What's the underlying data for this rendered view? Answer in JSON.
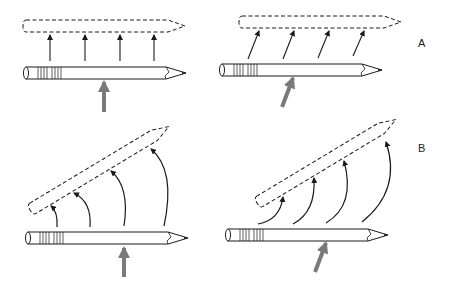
{
  "figure": {
    "panel_labels": {
      "A": "A",
      "B": "B"
    },
    "panels": [
      {
        "id": "A-left",
        "row": "A",
        "description": "Pencil lifted straight up; force arrow vertical at center; 4 parallel vertical motion arrows to dashed outline"
      },
      {
        "id": "A-right",
        "row": "A",
        "description": "Pencil lifted; force arrow oblique; 4 parallel slanted motion arrows to dashed outline"
      },
      {
        "id": "B-left",
        "row": "B",
        "description": "Pencil rotated about eraser end; vertical force arrow; 4 curved arrows of increasing length to tilted dashed outline"
      },
      {
        "id": "B-right",
        "row": "B",
        "description": "Pencil rotated; oblique force arrow; 4 curved arrows to tilted dashed outline"
      }
    ],
    "colors": {
      "line": "#1a1a1a",
      "force_arrow": "#7a7a7a",
      "background": "#ffffff"
    }
  }
}
